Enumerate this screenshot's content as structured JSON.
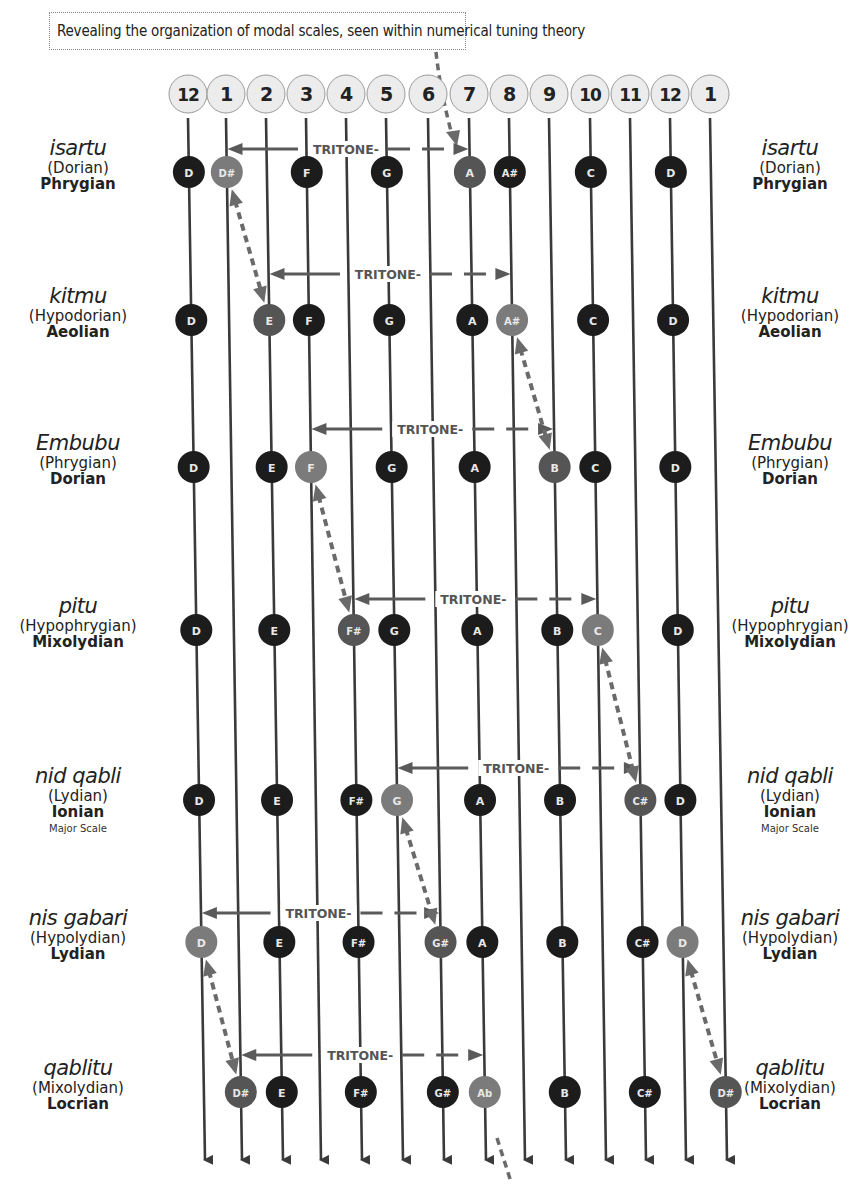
{
  "title": "Revealing the organization of modal scales, seen within numerical tuning theory",
  "colors": {
    "line": "#3a3a3a",
    "note_dark": "#1c1c1c",
    "note_highlight_light": "#7b7b7b",
    "note_highlight_dark": "#555555",
    "header_fill": "#ececec",
    "header_stroke": "#999999",
    "dashed_arrow": "#6a6a6a",
    "tritone_line": "#5a5a5a"
  },
  "columns": {
    "labels": [
      "12",
      "1",
      "2",
      "3",
      "4",
      "5",
      "6",
      "7",
      "8",
      "9",
      "10",
      "11",
      "12",
      "1"
    ],
    "x_top": [
      188,
      226,
      266,
      306,
      346,
      386,
      428,
      469,
      509,
      549,
      590,
      630,
      670,
      710
    ],
    "x_bottom": [
      205,
      242,
      283,
      321,
      362,
      403,
      444,
      486,
      525,
      566,
      606,
      646,
      686,
      727
    ],
    "y_top": 118,
    "y_bottom": 1168
  },
  "header_circles": {
    "y": 94,
    "r": 19
  },
  "modes": [
    {
      "name": "isartu",
      "paren": "(Dorian)",
      "greek": "Phrygian",
      "extra": "",
      "y": 172,
      "notes": [
        {
          "col": 0,
          "label": "D",
          "style": "dark"
        },
        {
          "col": 1,
          "label": "D#",
          "style": "light"
        },
        {
          "col": 3,
          "label": "F",
          "style": "dark"
        },
        {
          "col": 5,
          "label": "G",
          "style": "dark"
        },
        {
          "col": 7,
          "label": "A",
          "style": "mid"
        },
        {
          "col": 8,
          "label": "A#",
          "style": "dark"
        },
        {
          "col": 10,
          "label": "C",
          "style": "dark"
        },
        {
          "col": 12,
          "label": "D",
          "style": "dark"
        }
      ],
      "tritone": {
        "from_col": 1,
        "to_col": 7,
        "y": 149,
        "label": "TRITONE"
      }
    },
    {
      "name": "kitmu",
      "paren": "(Hypodorian)",
      "greek": "Aeolian",
      "extra": "",
      "y": 320,
      "notes": [
        {
          "col": 0,
          "label": "D",
          "style": "dark"
        },
        {
          "col": 2,
          "label": "E",
          "style": "mid"
        },
        {
          "col": 3,
          "label": "F",
          "style": "dark"
        },
        {
          "col": 5,
          "label": "G",
          "style": "dark"
        },
        {
          "col": 7,
          "label": "A",
          "style": "dark"
        },
        {
          "col": 8,
          "label": "A#",
          "style": "light"
        },
        {
          "col": 10,
          "label": "C",
          "style": "dark"
        },
        {
          "col": 12,
          "label": "D",
          "style": "dark"
        }
      ],
      "tritone": {
        "from_col": 2,
        "to_col": 8,
        "y": 274,
        "label": "TRITONE"
      }
    },
    {
      "name": "Embubu",
      "paren": "(Phrygian)",
      "greek": "Dorian",
      "extra": "",
      "y": 467,
      "notes": [
        {
          "col": 0,
          "label": "D",
          "style": "dark"
        },
        {
          "col": 2,
          "label": "E",
          "style": "dark"
        },
        {
          "col": 3,
          "label": "F",
          "style": "light"
        },
        {
          "col": 5,
          "label": "G",
          "style": "dark"
        },
        {
          "col": 7,
          "label": "A",
          "style": "dark"
        },
        {
          "col": 9,
          "label": "B",
          "style": "mid"
        },
        {
          "col": 10,
          "label": "C",
          "style": "dark"
        },
        {
          "col": 12,
          "label": "D",
          "style": "dark"
        }
      ],
      "tritone": {
        "from_col": 3,
        "to_col": 9,
        "y": 429,
        "label": "TRITONE"
      }
    },
    {
      "name": "pitu",
      "paren": "(Hypophrygian)",
      "greek": "Mixolydian",
      "extra": "",
      "y": 630,
      "notes": [
        {
          "col": 0,
          "label": "D",
          "style": "dark"
        },
        {
          "col": 2,
          "label": "E",
          "style": "dark"
        },
        {
          "col": 4,
          "label": "F#",
          "style": "mid"
        },
        {
          "col": 5,
          "label": "G",
          "style": "dark"
        },
        {
          "col": 7,
          "label": "A",
          "style": "dark"
        },
        {
          "col": 9,
          "label": "B",
          "style": "dark"
        },
        {
          "col": 10,
          "label": "C",
          "style": "light"
        },
        {
          "col": 12,
          "label": "D",
          "style": "dark"
        }
      ],
      "tritone": {
        "from_col": 4,
        "to_col": 10,
        "y": 599,
        "label": "TRITONE"
      }
    },
    {
      "name": "nid qabli",
      "paren": "(Lydian)",
      "greek": "Ionian",
      "extra": "Major Scale",
      "y": 800,
      "notes": [
        {
          "col": 0,
          "label": "D",
          "style": "dark"
        },
        {
          "col": 2,
          "label": "E",
          "style": "dark"
        },
        {
          "col": 4,
          "label": "F#",
          "style": "dark"
        },
        {
          "col": 5,
          "label": "G",
          "style": "light"
        },
        {
          "col": 7,
          "label": "A",
          "style": "dark"
        },
        {
          "col": 9,
          "label": "B",
          "style": "dark"
        },
        {
          "col": 11,
          "label": "C#",
          "style": "mid"
        },
        {
          "col": 12,
          "label": "D",
          "style": "dark"
        }
      ],
      "tritone": {
        "from_col": 5,
        "to_col": 11,
        "y": 768,
        "label": "TRITONE"
      }
    },
    {
      "name": "nis gabari",
      "paren": "(Hypolydian)",
      "greek": "Lydian",
      "extra": "",
      "y": 942,
      "notes": [
        {
          "col": 0,
          "label": "D",
          "style": "light"
        },
        {
          "col": 2,
          "label": "E",
          "style": "dark"
        },
        {
          "col": 4,
          "label": "F#",
          "style": "dark"
        },
        {
          "col": 6,
          "label": "G#",
          "style": "mid"
        },
        {
          "col": 7,
          "label": "A",
          "style": "dark"
        },
        {
          "col": 9,
          "label": "B",
          "style": "dark"
        },
        {
          "col": 11,
          "label": "C#",
          "style": "dark"
        },
        {
          "col": 12,
          "label": "D",
          "style": "light"
        }
      ],
      "tritone": {
        "from_col": 0,
        "to_col": 6,
        "y": 913,
        "label": "TRITONE"
      }
    },
    {
      "name": "qablitu",
      "paren": "(Mixolydian)",
      "greek": "Locrian",
      "extra": "",
      "y": 1092,
      "notes": [
        {
          "col": 1,
          "label": "D#",
          "style": "mid"
        },
        {
          "col": 2,
          "label": "E",
          "style": "dark"
        },
        {
          "col": 4,
          "label": "F#",
          "style": "dark"
        },
        {
          "col": 6,
          "label": "G#",
          "style": "dark"
        },
        {
          "col": 7,
          "label": "Ab",
          "style": "light"
        },
        {
          "col": 9,
          "label": "B",
          "style": "dark"
        },
        {
          "col": 11,
          "label": "C#",
          "style": "dark"
        },
        {
          "col": 13,
          "label": "D#",
          "style": "mid"
        }
      ],
      "tritone": {
        "from_col": 1,
        "to_col": 7,
        "y": 1055,
        "label": "TRITONE"
      }
    }
  ],
  "dashed_links": [
    {
      "from": [
        0,
        1
      ],
      "to": [
        1,
        2
      ]
    },
    {
      "from": [
        1,
        8
      ],
      "to": [
        2,
        9
      ]
    },
    {
      "from": [
        2,
        3
      ],
      "to": [
        3,
        4
      ]
    },
    {
      "from": [
        3,
        10
      ],
      "to": [
        4,
        11
      ]
    },
    {
      "from": [
        4,
        5
      ],
      "to": [
        5,
        6
      ]
    },
    {
      "from": [
        5,
        0
      ],
      "to": [
        6,
        1
      ]
    },
    {
      "from": [
        5,
        12
      ],
      "to": [
        6,
        13
      ]
    }
  ],
  "side_labels": {
    "left_x": 78,
    "right_x": 790
  }
}
